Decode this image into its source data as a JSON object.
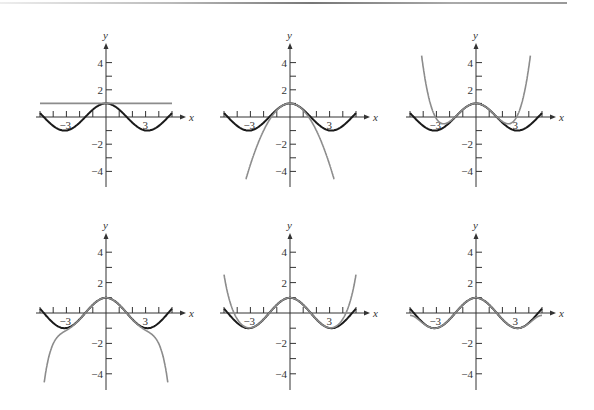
{
  "figure": {
    "curve_colors": {
      "function": "#1a1a1a",
      "approximation": "#8c8c8c"
    },
    "axis_labels": {
      "x": "x",
      "y": "y"
    },
    "x_tick_labels": [
      "-3",
      "3"
    ],
    "y_tick_labels": [
      "4",
      "2",
      "-2",
      "-4"
    ]
  },
  "chart_data": [
    {
      "type": "line",
      "title": "",
      "function": "cos x",
      "approximation": "P0(x) = 1",
      "xlabel": "x",
      "ylabel": "y",
      "xlim": [
        -5,
        5
      ],
      "ylim": [
        -5,
        5
      ],
      "x_ticks": [
        -5,
        -4,
        -3,
        -2,
        -1,
        0,
        1,
        2,
        3,
        4,
        5
      ],
      "y_ticks": [
        -4,
        -3,
        -2,
        -1,
        1,
        2,
        3,
        4
      ],
      "series": [
        {
          "name": "cos x",
          "color": "#1a1a1a"
        },
        {
          "name": "P0",
          "color": "#8c8c8c",
          "coefficients": [
            1
          ]
        }
      ]
    },
    {
      "type": "line",
      "title": "",
      "function": "cos x",
      "approximation": "P2(x) = 1 - x^2/2",
      "xlabel": "x",
      "ylabel": "y",
      "xlim": [
        -5,
        5
      ],
      "ylim": [
        -5,
        5
      ],
      "x_ticks": [
        -5,
        -4,
        -3,
        -2,
        -1,
        0,
        1,
        2,
        3,
        4,
        5
      ],
      "y_ticks": [
        -4,
        -3,
        -2,
        -1,
        1,
        2,
        3,
        4
      ],
      "series": [
        {
          "name": "cos x",
          "color": "#1a1a1a"
        },
        {
          "name": "P2",
          "color": "#8c8c8c",
          "coefficients": [
            1,
            0,
            -0.5
          ]
        }
      ]
    },
    {
      "type": "line",
      "title": "",
      "function": "cos x",
      "approximation": "P4(x) = 1 - x^2/2 + x^4/24",
      "xlabel": "x",
      "ylabel": "y",
      "xlim": [
        -5,
        5
      ],
      "ylim": [
        -5,
        5
      ],
      "x_ticks": [
        -5,
        -4,
        -3,
        -2,
        -1,
        0,
        1,
        2,
        3,
        4,
        5
      ],
      "y_ticks": [
        -4,
        -3,
        -2,
        -1,
        1,
        2,
        3,
        4
      ],
      "series": [
        {
          "name": "cos x",
          "color": "#1a1a1a"
        },
        {
          "name": "P4",
          "color": "#8c8c8c",
          "coefficients": [
            1,
            0,
            -0.5,
            0,
            0.0416667
          ]
        }
      ]
    },
    {
      "type": "line",
      "title": "",
      "function": "cos x",
      "approximation": "P6(x)",
      "xlabel": "x",
      "ylabel": "y",
      "xlim": [
        -5,
        5
      ],
      "ylim": [
        -5,
        5
      ],
      "x_ticks": [
        -5,
        -4,
        -3,
        -2,
        -1,
        0,
        1,
        2,
        3,
        4,
        5
      ],
      "y_ticks": [
        -4,
        -3,
        -2,
        -1,
        1,
        2,
        3,
        4
      ],
      "series": [
        {
          "name": "cos x",
          "color": "#1a1a1a"
        },
        {
          "name": "P6",
          "color": "#8c8c8c",
          "coefficients": [
            1,
            0,
            -0.5,
            0,
            0.0416667,
            0,
            -0.00138889
          ]
        }
      ]
    },
    {
      "type": "line",
      "title": "",
      "function": "cos x",
      "approximation": "P8(x)",
      "xlabel": "x",
      "ylabel": "y",
      "xlim": [
        -5,
        5
      ],
      "ylim": [
        -5,
        5
      ],
      "x_ticks": [
        -5,
        -4,
        -3,
        -2,
        -1,
        0,
        1,
        2,
        3,
        4,
        5
      ],
      "y_ticks": [
        -4,
        -3,
        -2,
        -1,
        1,
        2,
        3,
        4
      ],
      "series": [
        {
          "name": "cos x",
          "color": "#1a1a1a"
        },
        {
          "name": "P8",
          "color": "#8c8c8c",
          "coefficients": [
            1,
            0,
            -0.5,
            0,
            0.0416667,
            0,
            -0.00138889,
            0,
            2.48016e-05
          ]
        }
      ]
    },
    {
      "type": "line",
      "title": "",
      "function": "cos x",
      "approximation": "P10(x)",
      "xlabel": "x",
      "ylabel": "y",
      "xlim": [
        -5,
        5
      ],
      "ylim": [
        -5,
        5
      ],
      "x_ticks": [
        -5,
        -4,
        -3,
        -2,
        -1,
        0,
        1,
        2,
        3,
        4,
        5
      ],
      "y_ticks": [
        -4,
        -3,
        -2,
        -1,
        1,
        2,
        3,
        4
      ],
      "series": [
        {
          "name": "cos x",
          "color": "#1a1a1a"
        },
        {
          "name": "P10",
          "color": "#8c8c8c",
          "coefficients": [
            1,
            0,
            -0.5,
            0,
            0.0416667,
            0,
            -0.00138889,
            0,
            2.48016e-05,
            0,
            -2.75573e-07
          ]
        }
      ]
    }
  ],
  "layout": {
    "panels": [
      {
        "ox": 106,
        "oy": 117,
        "sx": 13.2,
        "sy": 13.6,
        "ytop": 43,
        "ybot": 187
      },
      {
        "ox": 290,
        "oy": 117,
        "sx": 13.2,
        "sy": 13.6,
        "ytop": 43,
        "ybot": 187
      },
      {
        "ox": 476,
        "oy": 117,
        "sx": 13.2,
        "sy": 13.6,
        "ytop": 43,
        "ybot": 187
      },
      {
        "ox": 106,
        "oy": 313,
        "sx": 13.2,
        "sy": 15.2,
        "ytop": 233,
        "ybot": 390
      },
      {
        "ox": 290,
        "oy": 313,
        "sx": 13.2,
        "sy": 15.2,
        "ytop": 233,
        "ybot": 390
      },
      {
        "ox": 476,
        "oy": 313,
        "sx": 13.2,
        "sy": 15.2,
        "ytop": 233,
        "ybot": 390
      }
    ]
  }
}
